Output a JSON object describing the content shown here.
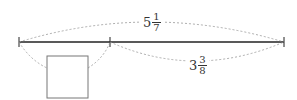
{
  "diagram": {
    "total_length": {
      "whole": "5",
      "numerator": "1",
      "denominator": "7"
    },
    "right_segment": {
      "whole": "3",
      "numerator": "3",
      "denominator": "8"
    },
    "unknown_box": ""
  }
}
